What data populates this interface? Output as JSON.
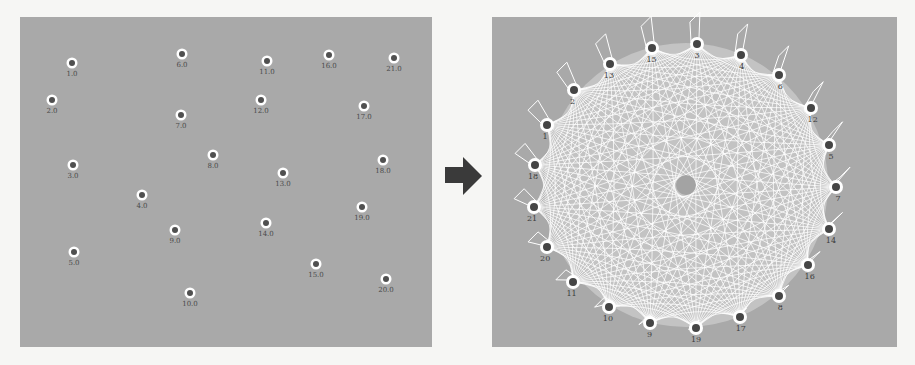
{
  "figure": {
    "left_panel": {
      "description": "scattered unconnected nodes",
      "background": "#a9a9a9",
      "nodes": [
        {
          "label": "1.0",
          "x": 72,
          "y": 63
        },
        {
          "label": "6.0",
          "x": 182,
          "y": 54
        },
        {
          "label": "11.0",
          "x": 267,
          "y": 61
        },
        {
          "label": "16.0",
          "x": 329,
          "y": 55
        },
        {
          "label": "21.0",
          "x": 394,
          "y": 58
        },
        {
          "label": "2.0",
          "x": 52,
          "y": 100
        },
        {
          "label": "7.0",
          "x": 181,
          "y": 115
        },
        {
          "label": "12.0",
          "x": 261,
          "y": 100
        },
        {
          "label": "17.0",
          "x": 364,
          "y": 106
        },
        {
          "label": "3.0",
          "x": 73,
          "y": 165
        },
        {
          "label": "8.0",
          "x": 213,
          "y": 155
        },
        {
          "label": "13.0",
          "x": 283,
          "y": 173
        },
        {
          "label": "18.0",
          "x": 383,
          "y": 160
        },
        {
          "label": "4.0",
          "x": 142,
          "y": 195
        },
        {
          "label": "9.0",
          "x": 175,
          "y": 230
        },
        {
          "label": "14.0",
          "x": 266,
          "y": 223
        },
        {
          "label": "19.0",
          "x": 362,
          "y": 207
        },
        {
          "label": "5.0",
          "x": 74,
          "y": 252
        },
        {
          "label": "10.0",
          "x": 190,
          "y": 293
        },
        {
          "label": "15.0",
          "x": 316,
          "y": 264
        },
        {
          "label": "20.0",
          "x": 386,
          "y": 279
        }
      ]
    },
    "arrow": {
      "icon": "right-arrow-icon",
      "color": "#3a3a3a"
    },
    "right_panel": {
      "description": "fully connected circular network graph",
      "background": "#a9a9a9",
      "edge_color": "#ffffff",
      "center": {
        "x": 686,
        "y": 185
      },
      "nodes": [
        {
          "label": "3",
          "x": 697,
          "y": 44
        },
        {
          "label": "4",
          "x": 741,
          "y": 55
        },
        {
          "label": "6",
          "x": 779,
          "y": 75
        },
        {
          "label": "12",
          "x": 811,
          "y": 108
        },
        {
          "label": "5",
          "x": 829,
          "y": 145
        },
        {
          "label": "7",
          "x": 836,
          "y": 187
        },
        {
          "label": "14",
          "x": 829,
          "y": 229
        },
        {
          "label": "16",
          "x": 808,
          "y": 265
        },
        {
          "label": "8",
          "x": 779,
          "y": 296
        },
        {
          "label": "17",
          "x": 740,
          "y": 317
        },
        {
          "label": "19",
          "x": 696,
          "y": 328
        },
        {
          "label": "9",
          "x": 650,
          "y": 323
        },
        {
          "label": "10",
          "x": 609,
          "y": 307
        },
        {
          "label": "11",
          "x": 573,
          "y": 282
        },
        {
          "label": "20",
          "x": 547,
          "y": 247
        },
        {
          "label": "21",
          "x": 534,
          "y": 207
        },
        {
          "label": "18",
          "x": 535,
          "y": 165
        },
        {
          "label": "1",
          "x": 547,
          "y": 125
        },
        {
          "label": "2",
          "x": 574,
          "y": 90
        },
        {
          "label": "13",
          "x": 610,
          "y": 64
        },
        {
          "label": "15",
          "x": 652,
          "y": 48
        }
      ]
    }
  }
}
